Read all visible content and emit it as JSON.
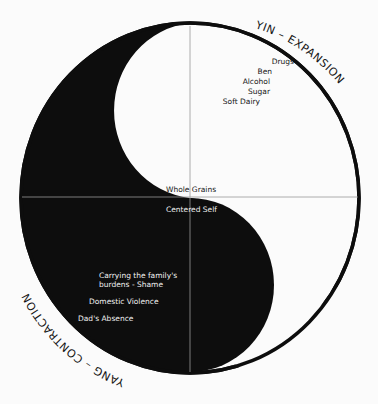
{
  "diagram": {
    "colors": {
      "background": "#fbfbfb",
      "yang_fill": "#0d0d0d",
      "yin_fill": "#fbfbfb",
      "axis_lines": "#9a9a9a",
      "outline": "#0d0d0d"
    },
    "arc_labels": {
      "yin": "YIN – EXPANSION",
      "yang": "YANG – CONTRACTION"
    },
    "yin_items": [
      "Drugs",
      "Ben",
      "Alcohol",
      "Sugar",
      "Soft Dairy"
    ],
    "center_items": {
      "top": "Whole Grains",
      "bottom": "Centered Self"
    },
    "yang_items": {
      "item1_line1": "Carrying the family's",
      "item1_line2": "burdens - Shame",
      "item2": "Domestic Violence",
      "item3": "Dad's Absence"
    }
  }
}
